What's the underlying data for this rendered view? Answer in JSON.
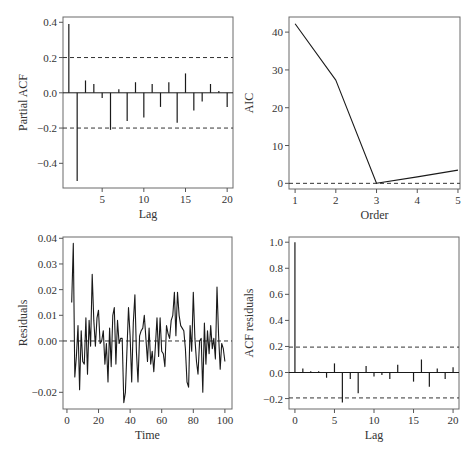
{
  "chart_data": [
    {
      "id": "pacf",
      "type": "bar",
      "title": "",
      "xlabel": "Lag",
      "ylabel": "Partial ACF",
      "xticks": [
        5,
        10,
        15,
        20
      ],
      "yticks": [
        0.4,
        0.2,
        0.0,
        -0.2,
        -0.4
      ],
      "ytick_labels": [
        "0.4",
        "0.2",
        "0.0",
        "-0.2",
        "-0.4"
      ],
      "xlim": [
        0.3,
        20.7
      ],
      "ylim": [
        -0.54,
        0.43
      ],
      "x": [
        1,
        2,
        3,
        4,
        5,
        6,
        7,
        8,
        9,
        10,
        11,
        12,
        13,
        14,
        15,
        16,
        17,
        18,
        19,
        20
      ],
      "values": [
        0.39,
        -0.5,
        0.07,
        0.05,
        -0.03,
        -0.21,
        0.02,
        -0.16,
        0.06,
        -0.14,
        0.05,
        -0.08,
        0.06,
        -0.17,
        0.11,
        -0.1,
        -0.05,
        0.05,
        0.01,
        -0.08
      ],
      "confidence_bounds": [
        0.2,
        -0.2
      ],
      "grid": false
    },
    {
      "id": "aic",
      "type": "line",
      "title": "",
      "xlabel": "Order",
      "ylabel": "AIC",
      "xticks": [
        1,
        2,
        3,
        4,
        5
      ],
      "yticks": [
        0,
        10,
        20,
        30,
        40
      ],
      "ytick_labels": [
        "0",
        "10",
        "20",
        "30",
        "40"
      ],
      "xlim": [
        0.85,
        5.05
      ],
      "ylim": [
        -1.5,
        44
      ],
      "x": [
        1,
        2,
        3,
        4,
        5
      ],
      "values": [
        42.2,
        27.3,
        0.0,
        1.7,
        3.5
      ],
      "reference_line": 0,
      "grid": false
    },
    {
      "id": "residuals",
      "type": "line",
      "title": "",
      "xlabel": "Time",
      "ylabel": "Residuals",
      "xticks": [
        0,
        20,
        40,
        60,
        80,
        100
      ],
      "yticks": [
        0.04,
        0.03,
        0.02,
        0.01,
        0.0,
        -0.02
      ],
      "ytick_labels": [
        "0.04",
        "0.03",
        "0.02",
        "0.01",
        "0.00",
        "-0.02"
      ],
      "xlim": [
        -2.5,
        104.5
      ],
      "ylim": [
        -0.0265,
        0.0405
      ],
      "x": [
        3,
        4,
        5,
        6,
        7,
        8,
        9,
        10,
        11,
        12,
        13,
        14,
        15,
        16,
        17,
        18,
        19,
        20,
        21,
        22,
        23,
        24,
        25,
        26,
        27,
        28,
        29,
        30,
        31,
        32,
        33,
        34,
        35,
        36,
        37,
        38,
        39,
        40,
        41,
        42,
        43,
        44,
        45,
        46,
        47,
        48,
        49,
        50,
        51,
        52,
        53,
        54,
        55,
        56,
        57,
        58,
        59,
        60,
        61,
        62,
        63,
        64,
        65,
        66,
        67,
        68,
        69,
        70,
        71,
        72,
        73,
        74,
        75,
        76,
        77,
        78,
        79,
        80,
        81,
        82,
        83,
        84,
        85,
        86,
        87,
        88,
        89,
        90,
        91,
        92,
        93,
        94,
        95,
        96,
        97,
        98,
        99,
        100
      ],
      "values": [
        0.015,
        0.038,
        -0.014,
        -0.006,
        0.006,
        -0.019,
        0.004,
        -0.008,
        -0.009,
        0.009,
        -0.013,
        0.008,
        -0.002,
        0.026,
        0.008,
        -0.002,
        0.009,
        0.012,
        -0.001,
        0.0,
        0.004,
        -0.009,
        -0.001,
        -0.016,
        0.005,
        -0.01,
        0.01,
        0.013,
        -0.009,
        0.008,
        -0.001,
        0.001,
        0.001,
        -0.024,
        -0.02,
        -0.003,
        0.013,
        0.002,
        -0.016,
        0.007,
        0.018,
        -0.004,
        -0.016,
        0.002,
        0.004,
        0.005,
        0.01,
        0.001,
        -0.008,
        0.005,
        -0.009,
        -0.004,
        -0.012,
        -0.002,
        0.009,
        -0.006,
        0.009,
        -0.004,
        -0.005,
        -0.01,
        0.006,
        0.003,
        0.001,
        0.008,
        0.01,
        0.019,
        0.002,
        0.019,
        0.01,
        0.006,
        0.005,
        0.004,
        -0.003,
        -0.016,
        -0.018,
        0.006,
        -0.004,
        0.019,
        0.001,
        -0.008,
        -0.013,
        0.0,
        0.001,
        -0.02,
        0.007,
        -0.009,
        0.004,
        -0.005,
        0.006,
        -0.003,
        0.001,
        -0.007,
        0.021,
        0.002,
        -0.011,
        -0.001,
        -0.003,
        -0.008
      ],
      "reference_line": 0,
      "grid": false
    },
    {
      "id": "acf_residuals",
      "type": "bar",
      "title": "",
      "xlabel": "Lag",
      "ylabel": "ACF residuals",
      "xticks": [
        0,
        5,
        10,
        15,
        20
      ],
      "yticks": [
        1.0,
        0.8,
        0.6,
        0.4,
        0.2,
        0.0,
        -0.2
      ],
      "ytick_labels": [
        "1.0",
        "0.8",
        "0.6",
        "0.4",
        "0.2",
        "0.0",
        "-0.2"
      ],
      "xlim": [
        -0.75,
        20.75
      ],
      "ylim": [
        -0.28,
        1.04
      ],
      "x": [
        0,
        1,
        2,
        3,
        4,
        5,
        6,
        7,
        8,
        9,
        10,
        11,
        12,
        13,
        14,
        15,
        16,
        17,
        18,
        19,
        20
      ],
      "values": [
        1.0,
        0.03,
        0.01,
        0.01,
        -0.04,
        0.07,
        -0.23,
        -0.05,
        -0.16,
        0.05,
        -0.03,
        -0.02,
        -0.05,
        0.06,
        0.0,
        -0.07,
        0.1,
        -0.11,
        0.03,
        -0.05,
        0.04
      ],
      "confidence_bounds": [
        0.195,
        -0.195
      ],
      "grid": false
    }
  ],
  "panels": [
    {
      "name": "pacf-panel",
      "frame": [
        63,
        17,
        233,
        188
      ]
    },
    {
      "name": "aic-panel",
      "frame": [
        289,
        17,
        460,
        189
      ]
    },
    {
      "name": "residuals-panel",
      "frame": [
        63,
        237,
        232,
        409
      ]
    },
    {
      "name": "acf-residuals-panel",
      "frame": [
        289,
        237,
        459,
        409
      ]
    }
  ]
}
